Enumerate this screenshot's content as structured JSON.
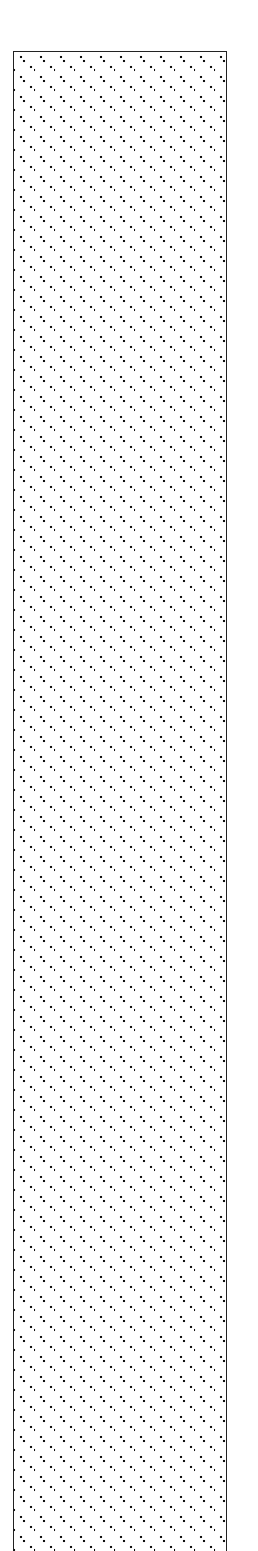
{
  "figure": {
    "element": "pattern-filled-bar",
    "fill_pattern": "diagonal-dots",
    "colors": {
      "border": "#222222",
      "dots": "#111111",
      "background": "#ffffff"
    }
  }
}
